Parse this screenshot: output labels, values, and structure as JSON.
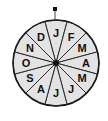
{
  "figure": {
    "name": "month-wheel",
    "background_color": "#ffffff",
    "sector_fill_color": "#e3e3e3",
    "sector_stroke_color": "#2a2a2a",
    "label_color": "#111111",
    "hub_color": "#111111",
    "pointer_color": "#111111"
  },
  "geometry": {
    "center_x": 56,
    "center_y": 63,
    "radius": 43,
    "sector_count": 12,
    "sector_angle_degrees": 30,
    "label_radius": 30,
    "hub_radius": 3,
    "pointer_x": 55,
    "pointer_y": 9,
    "pointer_size": 4
  },
  "sectors": [
    {
      "label": "J",
      "index": 0,
      "start_angle": -15,
      "end_angle": 15,
      "label_angle": 0,
      "name": "sector-january"
    },
    {
      "label": "F",
      "index": 1,
      "start_angle": 15,
      "end_angle": 45,
      "label_angle": 30,
      "name": "sector-february"
    },
    {
      "label": "M",
      "index": 2,
      "start_angle": 45,
      "end_angle": 75,
      "label_angle": 60,
      "name": "sector-march"
    },
    {
      "label": "A",
      "index": 3,
      "start_angle": 75,
      "end_angle": 105,
      "label_angle": 90,
      "name": "sector-april"
    },
    {
      "label": "M",
      "index": 4,
      "start_angle": 105,
      "end_angle": 135,
      "label_angle": 120,
      "name": "sector-may"
    },
    {
      "label": "J",
      "index": 5,
      "start_angle": 135,
      "end_angle": 165,
      "label_angle": 150,
      "name": "sector-june"
    },
    {
      "label": "J",
      "index": 6,
      "start_angle": 165,
      "end_angle": 195,
      "label_angle": 180,
      "name": "sector-july"
    },
    {
      "label": "A",
      "index": 7,
      "start_angle": 195,
      "end_angle": 225,
      "label_angle": 210,
      "name": "sector-august"
    },
    {
      "label": "S",
      "index": 8,
      "start_angle": 225,
      "end_angle": 255,
      "label_angle": 240,
      "name": "sector-september"
    },
    {
      "label": "O",
      "index": 9,
      "start_angle": 255,
      "end_angle": 285,
      "label_angle": 270,
      "name": "sector-october"
    },
    {
      "label": "N",
      "index": 10,
      "start_angle": 285,
      "end_angle": 315,
      "label_angle": 300,
      "name": "sector-november"
    },
    {
      "label": "D",
      "index": 11,
      "start_angle": 315,
      "end_angle": 345,
      "label_angle": 330,
      "name": "sector-december"
    }
  ]
}
